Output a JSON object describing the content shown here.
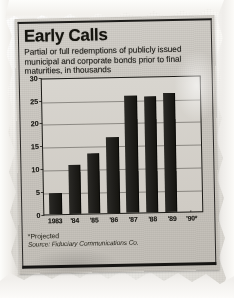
{
  "clipping": {
    "headline": "Early Calls",
    "subtitle": "Partial or full redemptions of publicly issued municipal and corporate bonds prior to final maturities, in thousands",
    "footnote": "*Projected",
    "source": "Source: Fiduciary Communications Co."
  },
  "colors": {
    "bar": "#1a1915",
    "newsprint": "#cdc9c2",
    "ink": "#16150f",
    "paper": "#f2f0ec"
  },
  "chart_data": {
    "type": "bar",
    "title": "Early Calls",
    "subtitle": "Partial or full redemptions of publicly issued municipal and corporate bonds prior to final maturities, in thousands",
    "categories": [
      "1983",
      "'84",
      "'85",
      "'86",
      "'87",
      "'88",
      "'89",
      "'90*"
    ],
    "values": [
      4.5,
      10.7,
      13.0,
      16.7,
      25.5,
      25.3,
      26.0,
      0.2
    ],
    "xlabel": "",
    "ylabel": "",
    "ylim": [
      0,
      30
    ],
    "yticks": [
      0,
      5,
      10,
      15,
      20,
      25,
      30
    ],
    "ytick_labels": [
      "0",
      "5",
      "10",
      "15",
      "20",
      "25",
      "30"
    ],
    "grid": true,
    "legend": false,
    "units": "thousands",
    "notes": "*Projected",
    "source": "Source: Fiduciary Communications Co."
  }
}
